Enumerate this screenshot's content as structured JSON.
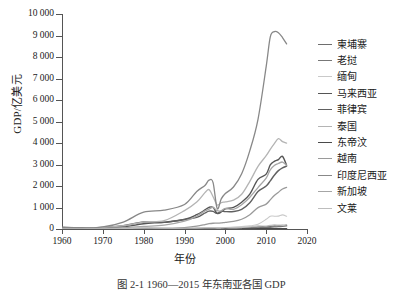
{
  "chart_data": {
    "type": "line",
    "title": "",
    "xlabel": "年份",
    "ylabel": "GDP/亿美元",
    "xlim": [
      1960,
      2020
    ],
    "ylim": [
      0,
      10000
    ],
    "xticks": [
      1960,
      1970,
      1980,
      1990,
      2000,
      2010,
      2020
    ],
    "ytick_labels": [
      "0",
      "1 000",
      "2 000",
      "3 000",
      "4 000",
      "5 000",
      "6 000",
      "7 000",
      "8 000",
      "9 000",
      "10 000"
    ],
    "yticks": [
      0,
      1000,
      2000,
      3000,
      4000,
      5000,
      6000,
      7000,
      8000,
      9000,
      10000
    ],
    "grid": false,
    "legend_position": "right",
    "x": [
      1960,
      1965,
      1970,
      1975,
      1980,
      1985,
      1990,
      1993,
      1995,
      1996,
      1997,
      1998,
      1999,
      2000,
      2002,
      2004,
      2006,
      2008,
      2010,
      2011,
      2012,
      2013,
      2014,
      2015
    ],
    "series": [
      {
        "name": "柬埔寨",
        "color": "#6e6e6e",
        "width": 1.3,
        "values": [
          0,
          0,
          0,
          0,
          0,
          0,
          9,
          24,
          32,
          35,
          34,
          36,
          37,
          37,
          43,
          52,
          73,
          103,
          112,
          128,
          140,
          153,
          168,
          180
        ]
      },
      {
        "name": "老挝",
        "color": "#777777",
        "width": 1.3,
        "values": [
          0,
          0,
          0,
          0,
          4,
          10,
          9,
          13,
          18,
          19,
          17,
          13,
          14,
          17,
          17,
          23,
          36,
          53,
          71,
          82,
          95,
          112,
          122,
          142
        ]
      },
      {
        "name": "缅甸",
        "color": "#c9c9c9",
        "width": 1.1,
        "values": [
          13,
          16,
          22,
          32,
          60,
          59,
          55,
          38,
          55,
          60,
          62,
          60,
          60,
          70,
          90,
          115,
          145,
          220,
          450,
          598,
          595,
          600,
          655,
          595
        ]
      },
      {
        "name": "马来西亚",
        "color": "#555555",
        "width": 1.4,
        "values": [
          19,
          30,
          39,
          92,
          247,
          317,
          440,
          664,
          885,
          1008,
          1004,
          728,
          791,
          935,
          1007,
          1248,
          1626,
          2307,
          2551,
          2978,
          3148,
          3231,
          3380,
          2962
        ]
      },
      {
        "name": "菲律宾",
        "color": "#606060",
        "width": 1.4,
        "values": [
          69,
          60,
          69,
          149,
          323,
          307,
          444,
          541,
          744,
          829,
          823,
          725,
          829,
          810,
          814,
          914,
          1221,
          1742,
          1996,
          2241,
          2501,
          2716,
          2847,
          2922
        ]
      },
      {
        "name": "泰国",
        "color": "#b4b4b4",
        "width": 1.3,
        "values": [
          27,
          42,
          71,
          152,
          324,
          386,
          855,
          1251,
          1690,
          1832,
          1502,
          1116,
          1227,
          1263,
          1341,
          1615,
          2218,
          2914,
          3410,
          3707,
          3976,
          4204,
          4065,
          3995
        ]
      },
      {
        "name": "东帝汶",
        "color": "#4a4a4a",
        "width": 1.5,
        "values": [
          0,
          0,
          0,
          0,
          0,
          0,
          0,
          0,
          0,
          0,
          0,
          3,
          3,
          4,
          3,
          3,
          4,
          6,
          9,
          12,
          14,
          15,
          15,
          15
        ]
      },
      {
        "name": "越南",
        "color": "#9a9a9a",
        "width": 1.3,
        "values": [
          0,
          0,
          0,
          0,
          0,
          0,
          65,
          131,
          206,
          247,
          268,
          271,
          284,
          311,
          352,
          453,
          663,
          994,
          1159,
          1355,
          1558,
          1712,
          1862,
          1933
        ]
      },
      {
        "name": "印度尼西亚",
        "color": "#888888",
        "width": 1.3,
        "values": [
          89,
          38,
          94,
          324,
          785,
          877,
          1141,
          1747,
          2022,
          2272,
          2158,
          951,
          1400,
          1650,
          1954,
          2568,
          3645,
          5102,
          7552,
          8928,
          9178,
          9125,
          8906,
          8610
        ]
      },
      {
        "name": "新加坡",
        "color": "#a6a6a6",
        "width": 1.3,
        "values": [
          7,
          10,
          19,
          58,
          119,
          178,
          361,
          603,
          840,
          926,
          1004,
          851,
          845,
          960,
          917,
          1128,
          1476,
          1928,
          2368,
          2754,
          2955,
          3046,
          3115,
          2967
        ]
      },
      {
        "name": "文莱",
        "color": "#bdbdbd",
        "width": 1.2,
        "values": [
          0,
          0,
          1,
          17,
          48,
          36,
          36,
          43,
          49,
          53,
          53,
          40,
          46,
          60,
          50,
          67,
          94,
          144,
          135,
          167,
          190,
          180,
          171,
          129
        ]
      }
    ]
  },
  "caption": "图 2-1   1960—2015 年东南亚各国 GDP"
}
